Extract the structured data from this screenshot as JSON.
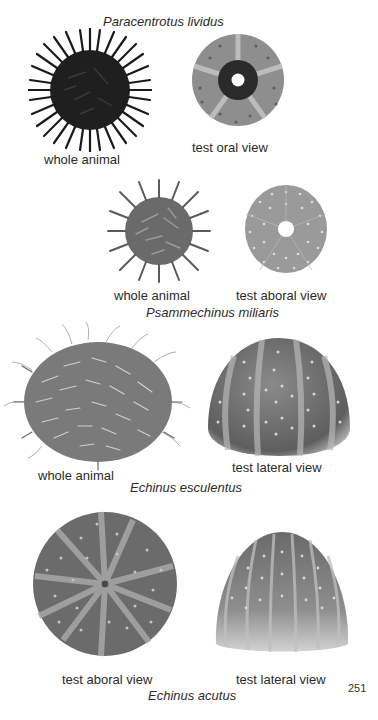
{
  "page": {
    "page_number": "251",
    "background": "#ffffff"
  },
  "plates": [
    {
      "species": "Paracentrotus lividus",
      "figures": [
        {
          "caption": "whole animal",
          "type": "whole-animal",
          "tone": "#1e1e1e"
        },
        {
          "caption": "test oral view",
          "type": "test-oral",
          "tone": "#8f8f8f"
        }
      ]
    },
    {
      "species": "Psammechinus miliaris",
      "figures": [
        {
          "caption": "whole animal",
          "type": "whole-animal",
          "tone": "#6e6e6e"
        },
        {
          "caption": "test aboral view",
          "type": "test-aboral",
          "tone": "#9a9a9a"
        }
      ]
    },
    {
      "species": "Echinus esculentus",
      "figures": [
        {
          "caption": "whole animal",
          "type": "whole-animal",
          "tone": "#7a7a7a"
        },
        {
          "caption": "test lateral view",
          "type": "test-lateral",
          "tone": "#777777"
        }
      ]
    },
    {
      "species": "Echinus acutus",
      "figures": [
        {
          "caption": "test aboral view",
          "type": "test-aboral",
          "tone": "#6c6c6c"
        },
        {
          "caption": "test lateral view",
          "type": "test-lateral",
          "tone": "#8a8a8a"
        }
      ]
    }
  ]
}
